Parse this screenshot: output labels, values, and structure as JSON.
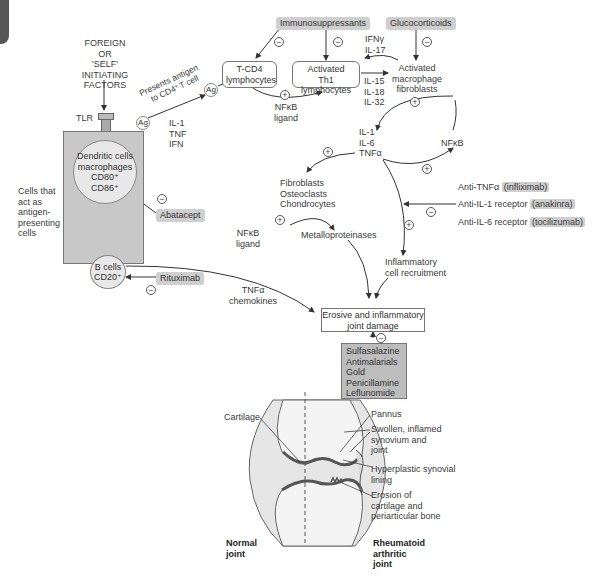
{
  "corner_tab_color": "#555555",
  "initiating": {
    "lines": [
      "FOREIGN",
      "OR",
      "'SELF'",
      "INITIATING",
      "FACTORS"
    ]
  },
  "tlr_label": "TLR",
  "apc_side_label": [
    "Cells that",
    "act as",
    "antigen-",
    "presenting",
    "cells"
  ],
  "apc_panel_color": "#c8c8c8",
  "dendritic": {
    "lines": [
      "Dendritic cells",
      "macrophages",
      "CD80⁺",
      "CD86⁺"
    ]
  },
  "bcells": {
    "lines": [
      "B cells",
      "CD20⁺"
    ]
  },
  "ag_label": "Ag",
  "presents_antigen": [
    "Presents antigen",
    "to CD4⁺T cell"
  ],
  "apc_cytokines": [
    "IL-1",
    "TNF",
    "IFN"
  ],
  "drugs": {
    "immunosuppressants": "Immunosuppressants",
    "glucocorticoids": "Glucocorticoids",
    "abatacept": "Abatacept",
    "rituximab": "Rituximab",
    "dmards": [
      "Sulfasalazine",
      "Antimalarials",
      "Gold",
      "Penicillamine",
      "Leflunomide"
    ],
    "biologics": [
      {
        "target": "Anti-TNFα",
        "drug": "(infliximab)"
      },
      {
        "target": "Anti-IL-1 receptor",
        "drug": "(anakinra)"
      },
      {
        "target": "Anti-IL-6 receptor",
        "drug": "(tocilizumab)"
      }
    ]
  },
  "tcd4": {
    "lines": [
      "T-CD4",
      "lymphocytes"
    ]
  },
  "th1": {
    "lines": [
      "Activated",
      "Th1 lymphocytes"
    ]
  },
  "nfkb_ligand_top": [
    "NFκB",
    "ligand"
  ],
  "ifn_il17": [
    "IFNγ",
    "IL-17"
  ],
  "il15_18_32": [
    "IL-15",
    "IL-18",
    "IL-32"
  ],
  "macrophage": {
    "lines": [
      "Activated",
      "macrophage",
      "fibroblasts"
    ]
  },
  "il1_il6_tnf": [
    "IL-1",
    "IL-6",
    "TNFα"
  ],
  "nfkb": "NFκB",
  "fibroblasts": [
    "Fibroblasts",
    "Osteoclasts",
    "Chondrocytes"
  ],
  "nfkb_ligand_mid": [
    "NFκB",
    "ligand"
  ],
  "metalloproteinases": "Metalloproteinases",
  "inflammatory_recruitment": [
    "Inflammatory",
    "cell recruitment"
  ],
  "tnf_chemokines": [
    "TNFα",
    "chemokines"
  ],
  "joint_damage": [
    "Erosive and inflammatory",
    "joint damage"
  ],
  "signs": {
    "plus": "+",
    "minus": "−"
  },
  "joint_labels": {
    "cartilage": "Cartilage",
    "pannus": "Pannus",
    "swollen": [
      "Swollen, inflamed",
      "synovium and",
      "joint"
    ],
    "hyperplastic": [
      "Hyperplastic synovial",
      "lining"
    ],
    "erosion": [
      "Erosion of",
      "cartilage and",
      "periarticular bone"
    ],
    "normal": [
      "Normal",
      "joint"
    ],
    "rheumatoid": [
      "Rheumatoid",
      "arthritic",
      "joint"
    ]
  }
}
